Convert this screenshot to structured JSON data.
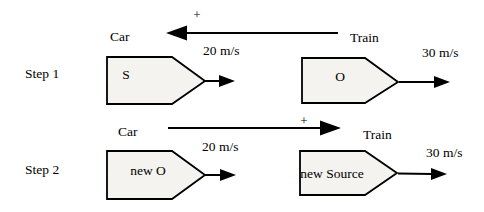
{
  "figure": {
    "background": "#ffffff",
    "ink": "#000000",
    "shape_fill": "#f4f3ef"
  },
  "steps": [
    {
      "label": "Step 1",
      "relative_sign": "+",
      "relative_arrow_direction": "left",
      "car": {
        "title": "Car",
        "speed": "20 m/s",
        "tag": "S"
      },
      "train": {
        "title": "Train",
        "speed": "30 m/s",
        "tag": "O"
      }
    },
    {
      "label": "Step 2",
      "relative_sign": "+",
      "relative_arrow_direction": "right",
      "car": {
        "title": "Car",
        "speed": "20 m/s",
        "tag": "new O"
      },
      "train": {
        "title": "Train",
        "speed": "30 m/s",
        "tag": "new Source"
      }
    }
  ]
}
